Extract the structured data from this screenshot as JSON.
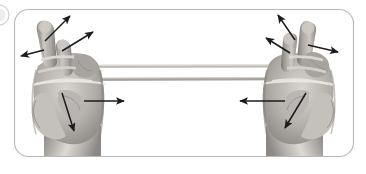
{
  "figure": {
    "title": "Two-hand elastic band finger abduction exercise",
    "description": "Grayscale photograph of two hands holding a stretched elastic resistance band looped around the fingers, with black arrows indicating movement directions.",
    "frame": {
      "shape": "rounded-rectangle",
      "border_color": "#b9b9b9",
      "border_width_px": 1,
      "corner_radius_px": 14,
      "fill_color": "#ffffff",
      "x": 14,
      "y": 9,
      "width": 340,
      "height": 148
    },
    "left_edge_marker": {
      "visible": true,
      "shape": "partial-circle-crop",
      "color": "#e3e3e3",
      "x": -10,
      "y": 5,
      "diameter": 20
    },
    "palette": {
      "skin_light": "#e8e4e0",
      "skin_mid": "#b6b2ae",
      "skin_shadow": "#8d8a87",
      "skin_deep_shadow": "#6e6c6a",
      "arrow_color": "#1c1c1c",
      "band_color": "#c9c6c2",
      "band_edge": "#8e8b88",
      "background": "#ffffff"
    }
  },
  "subjects": [
    {
      "name": "left-hand",
      "label": "Left hand",
      "side": "left",
      "cx": 73,
      "cy": 100,
      "fingers_up": 4,
      "band_anchor_x": 72,
      "band_anchor_y": 72
    },
    {
      "name": "right-hand",
      "label": "Right hand",
      "side": "right",
      "cx": 296,
      "cy": 100,
      "fingers_up": 4,
      "band_anchor_x": 292,
      "band_anchor_y": 72
    }
  ],
  "band": {
    "name": "elastic-resistance-band",
    "label": "Elastic resistance band",
    "type": "loop",
    "top_strand": {
      "x1": 76,
      "y1": 66,
      "x2": 289,
      "y2": 66
    },
    "bottom_strand": {
      "x1": 76,
      "y1": 79,
      "x2": 289,
      "y2": 79
    },
    "thickness_px": 3,
    "color": "#c9c6c2"
  },
  "arrows": [
    {
      "name": "arrow-left-index-up",
      "label": "Left index finger abduction up-right",
      "x1": 45,
      "y1": 41,
      "x2": 70,
      "y2": 16,
      "head_size": 6
    },
    {
      "name": "arrow-left-middle-up",
      "label": "Left middle finger abduction up-right",
      "x1": 62,
      "y1": 51,
      "x2": 93,
      "y2": 32,
      "head_size": 6
    },
    {
      "name": "arrow-left-thumb-out",
      "label": "Left thumb abduction left",
      "x1": 44,
      "y1": 50,
      "x2": 21,
      "y2": 56,
      "head_size": 6
    },
    {
      "name": "arrow-left-hand-inward",
      "label": "Left hand pull inward to the right",
      "x1": 84,
      "y1": 101,
      "x2": 124,
      "y2": 101,
      "head_size": 6
    },
    {
      "name": "arrow-left-palm-down",
      "label": "Left wrist direction down-left",
      "x1": 62,
      "y1": 93,
      "x2": 74,
      "y2": 131,
      "head_size": 6
    },
    {
      "name": "arrow-right-ring-up",
      "label": "Right ring finger abduction up-left",
      "x1": 295,
      "y1": 40,
      "x2": 278,
      "y2": 15,
      "head_size": 6
    },
    {
      "name": "arrow-right-middle-up",
      "label": "Right middle finger abduction up-left",
      "x1": 290,
      "y1": 53,
      "x2": 266,
      "y2": 38,
      "head_size": 6
    },
    {
      "name": "arrow-right-thumb-out",
      "label": "Right thumb abduction right",
      "x1": 308,
      "y1": 45,
      "x2": 338,
      "y2": 52,
      "head_size": 6
    },
    {
      "name": "arrow-right-hand-inward",
      "label": "Right hand pull inward to the left",
      "x1": 285,
      "y1": 101,
      "x2": 240,
      "y2": 101,
      "head_size": 6
    },
    {
      "name": "arrow-right-palm-down",
      "label": "Right wrist direction down-left",
      "x1": 306,
      "y1": 93,
      "x2": 285,
      "y2": 128,
      "head_size": 6
    }
  ]
}
